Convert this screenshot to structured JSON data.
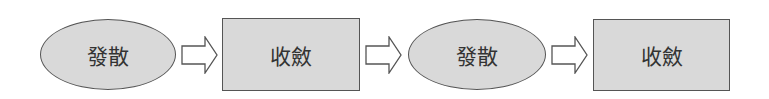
{
  "diagram": {
    "type": "flowchart",
    "direction": "left-to-right",
    "colors": {
      "node_fill": "#d9d9d9",
      "node_border": "#555555",
      "text": "#333333",
      "arrow_fill": "#ffffff",
      "arrow_border": "#555555"
    },
    "nodes": [
      {
        "id": "n1",
        "shape": "ellipse",
        "label": "發散"
      },
      {
        "id": "n2",
        "shape": "rectangle",
        "label": "收斂"
      },
      {
        "id": "n3",
        "shape": "ellipse",
        "label": "發散"
      },
      {
        "id": "n4",
        "shape": "rectangle",
        "label": "收斂"
      }
    ],
    "edges": [
      {
        "from": "n1",
        "to": "n2",
        "style": "block-arrow-outline"
      },
      {
        "from": "n2",
        "to": "n3",
        "style": "block-arrow-outline"
      },
      {
        "from": "n3",
        "to": "n4",
        "style": "block-arrow-outline"
      }
    ]
  }
}
